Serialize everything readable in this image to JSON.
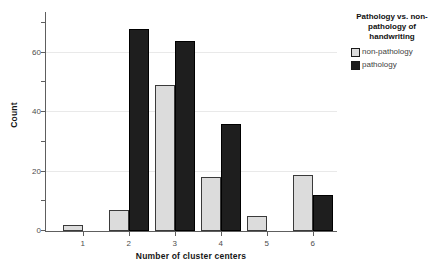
{
  "chart_data": {
    "type": "bar",
    "categories": [
      "1",
      "2",
      "3",
      "4",
      "5",
      "6"
    ],
    "series": [
      {
        "name": "non-pathology",
        "fill": "#dcdcdc",
        "border": "#3a3a3a",
        "values": [
          2,
          7,
          49,
          18,
          5,
          19
        ]
      },
      {
        "name": "pathology",
        "fill": "#1e1e1e",
        "border": "#000000",
        "values": [
          0,
          68,
          64,
          36,
          0,
          12
        ]
      }
    ],
    "title": "",
    "xlabel": "Number of cluster centers",
    "ylabel": "Count",
    "ylim": [
      0,
      74
    ],
    "yticks_major": [
      0,
      20,
      40,
      60
    ],
    "yticks_minor": [
      10,
      30,
      50,
      70
    ],
    "gridlines": [
      20,
      40,
      60
    ],
    "grid": true,
    "legend_position": "right",
    "legend_title": "Pathology vs. non-pathology of handwriting",
    "legend_title_lines": "Pathology vs. non-\npathology of\nhandwriting"
  },
  "colors": {
    "background": "#ffffff",
    "axis": "#5e5e5e",
    "gridline": "#e9e9e9",
    "tick_label": "#4d4d4d",
    "axis_title": "#161616"
  }
}
